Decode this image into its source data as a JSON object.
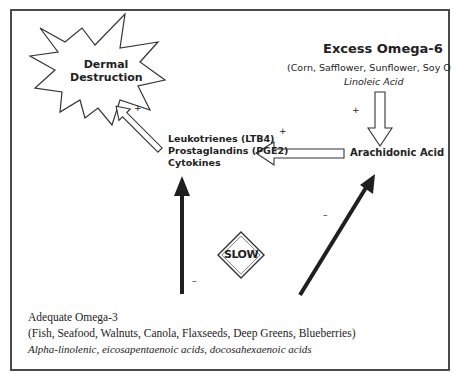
{
  "nodes": {
    "dermal_destruction": {
      "line1": "Dermal",
      "line2": "Destruction"
    },
    "excess_omega6": {
      "title": "Excess Omega-6",
      "sources": "(Corn, Safflower, Sunflower, Soy O",
      "acid": "Linoleic Acid"
    },
    "arachidonic_acid": {
      "label": "Arachidonic Acid"
    },
    "mediators": {
      "line1": "Leukotrienes (LTB4)",
      "line2": "Prostaglandins (PGE2)",
      "line3": "Cytokines"
    },
    "slow_sign": {
      "label": "SLOW"
    },
    "adequate_omega3": {
      "title": "Adequate Omega-3",
      "sources": "(Fish, Seafood, Walnuts, Canola, Flaxseeds, Deep Greens, Blueberries)",
      "acids_part1": "Alpha-linolenic",
      "acids_sep1": ", ",
      "acids_part2": "eicosapentaenoic acids",
      "acids_sep2": ", ",
      "acids_part3": "docosahexaenoic acids"
    }
  },
  "signs": {
    "plus": "+",
    "minus": "–"
  },
  "edges": [
    {
      "from": "excess_omega6",
      "to": "arachidonic_acid",
      "style": "hollow",
      "sign": "+"
    },
    {
      "from": "arachidonic_acid",
      "to": "mediators",
      "style": "hollow",
      "sign": "+"
    },
    {
      "from": "mediators",
      "to": "dermal_destruction",
      "style": "hollow",
      "sign": "+"
    },
    {
      "from": "adequate_omega3",
      "to": "mediators",
      "style": "solid",
      "sign": "-"
    },
    {
      "from": "adequate_omega3",
      "to": "arachidonic_acid",
      "style": "solid",
      "sign": "-"
    }
  ],
  "colors": {
    "frame": "#4a4a4a",
    "stroke": "#333333",
    "solid_arrow": "#1f1f1f",
    "text": "#222222"
  }
}
